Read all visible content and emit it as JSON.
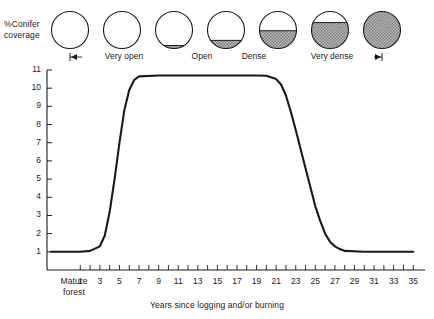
{
  "labels": {
    "y_axis_title": "%Conifer coverage",
    "y_axis_title_line1": "%Conifer",
    "y_axis_title_line2": "coverage",
    "x_axis_caption": "Years since logging and/or burning",
    "origin_label_line1": "Mature",
    "origin_label_line2": "forest"
  },
  "colors": {
    "line": "#1a1a1a",
    "axis": "#1a1a1a",
    "fill": "#9a9a9a",
    "background": "#ffffff"
  },
  "density_legend": [
    {
      "label": "",
      "fill_fraction": 0.0
    },
    {
      "label": "",
      "fill_fraction": 0.0
    },
    {
      "label": "",
      "fill_fraction": 0.08
    },
    {
      "label": "",
      "fill_fraction": 0.22
    },
    {
      "label": "",
      "fill_fraction": 0.48
    },
    {
      "label": "",
      "fill_fraction": 0.7
    },
    {
      "label": "",
      "fill_fraction": 1.0
    }
  ],
  "density_brackets": [
    {
      "label": "Very open",
      "start_circle": 1,
      "end_circle": 3
    },
    {
      "label": "Open",
      "start_circle": 3,
      "end_circle": 4
    },
    {
      "label": "Dense",
      "start_circle": 4,
      "end_circle": 5
    },
    {
      "label": "Very dense",
      "start_circle": 5,
      "end_circle": 7
    }
  ],
  "chart_data": {
    "type": "line",
    "title": "",
    "xlabel": "Years since logging and/or burning",
    "ylabel": "%Conifer coverage",
    "xlim": [
      -2,
      36
    ],
    "ylim": [
      0,
      11
    ],
    "grid": false,
    "legend": "none",
    "y_ticks": [
      1,
      2,
      3,
      4,
      5,
      6,
      7,
      8,
      9,
      10,
      11
    ],
    "y_tick_labels": [
      "1",
      "2",
      "3",
      "4",
      "5",
      "6",
      "7",
      "8",
      "9",
      "10",
      "11"
    ],
    "x_ticks": [
      1,
      2,
      3,
      4,
      5,
      6,
      7,
      8,
      9,
      10,
      11,
      12,
      13,
      14,
      15,
      16,
      17,
      18,
      19,
      20,
      21,
      22,
      23,
      24,
      25,
      26,
      27,
      28,
      29,
      30,
      31,
      32,
      33,
      34,
      35
    ],
    "x_tick_labels": [
      "1",
      "3",
      "5",
      "7",
      "9",
      "11",
      "13",
      "15",
      "17",
      "19",
      "21",
      "23",
      "25",
      "27",
      "29",
      "31",
      "33",
      "35"
    ],
    "x_labeled_ticks": [
      1,
      3,
      5,
      7,
      9,
      11,
      13,
      15,
      17,
      19,
      21,
      23,
      25,
      27,
      29,
      31,
      33,
      35
    ],
    "x_special_label": "Mature forest",
    "series": [
      {
        "name": "Conifer coverage",
        "x": [
          -2,
          -1,
          0,
          1,
          2,
          3,
          3.5,
          4,
          4.5,
          5,
          5.5,
          6,
          6.5,
          7,
          9,
          11,
          13,
          15,
          17,
          19,
          20,
          21,
          21.5,
          22,
          22.5,
          23,
          24,
          25,
          25.5,
          26,
          26.5,
          27,
          27.5,
          28,
          30,
          32,
          34,
          35
        ],
        "values": [
          1,
          1,
          1,
          1,
          1.05,
          1.3,
          1.9,
          3.2,
          5.0,
          7.0,
          8.8,
          9.9,
          10.45,
          10.65,
          10.7,
          10.7,
          10.7,
          10.7,
          10.7,
          10.7,
          10.68,
          10.5,
          10.2,
          9.6,
          8.7,
          7.7,
          5.6,
          3.5,
          2.7,
          2.0,
          1.55,
          1.3,
          1.15,
          1.05,
          1.0,
          1.0,
          1.0,
          1.0
        ]
      }
    ]
  }
}
